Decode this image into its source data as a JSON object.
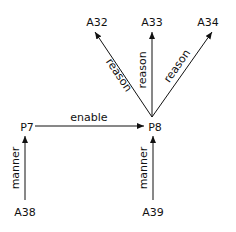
{
  "nodes": [
    {
      "id": "A32",
      "label": "A32",
      "x": 97,
      "y": 26
    },
    {
      "id": "A33",
      "label": "A33",
      "x": 152,
      "y": 26
    },
    {
      "id": "A34",
      "label": "A34",
      "x": 208,
      "y": 26
    },
    {
      "id": "P7",
      "label": "P7",
      "x": 27,
      "y": 131
    },
    {
      "id": "P8",
      "label": "P8",
      "x": 153,
      "y": 131
    },
    {
      "id": "A38",
      "label": "A38",
      "x": 25,
      "y": 216
    },
    {
      "id": "A39",
      "label": "A39",
      "x": 152,
      "y": 216
    }
  ],
  "edges": [
    {
      "from": "P8",
      "to": "A32",
      "label": "reason"
    },
    {
      "from": "P8",
      "to": "A33",
      "label": "reason"
    },
    {
      "from": "P8",
      "to": "A34",
      "label": "reason"
    },
    {
      "from": "P7",
      "to": "P8",
      "label": "enable"
    },
    {
      "from": "A38",
      "to": "P7",
      "label": "manner"
    },
    {
      "from": "A39",
      "to": "P8",
      "label": "manner"
    }
  ],
  "colors": {
    "line": "#111111",
    "text": "#111111",
    "background": "#ffffff"
  }
}
